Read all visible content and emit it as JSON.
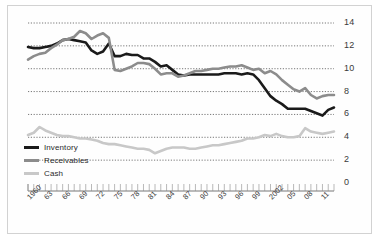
{
  "chart_data": {
    "type": "line",
    "title": "",
    "subtitle": "",
    "xlabel": "",
    "ylabel": "",
    "xlim": [
      1960,
      2013
    ],
    "ylim": [
      0,
      14
    ],
    "grid": true,
    "grid_style": "dotted-horizontal",
    "legend_position": "bottom-left",
    "y_ticks": [
      "0",
      "2",
      "4",
      "6",
      "8",
      "10",
      "12",
      "14"
    ],
    "y_tick_values": [
      0,
      2,
      4,
      6,
      8,
      10,
      12,
      14
    ],
    "x_ticks": [
      "1960",
      "63",
      "66",
      "69",
      "72",
      "75",
      "78",
      "81",
      "84",
      "87",
      "90",
      "93",
      "96",
      "99",
      "2002",
      "05",
      "08",
      "11"
    ],
    "x_tick_values": [
      1960,
      1963,
      1966,
      1969,
      1972,
      1975,
      1978,
      1981,
      1984,
      1987,
      1990,
      1993,
      1996,
      1999,
      2002,
      2005,
      2008,
      2011
    ],
    "x": [
      1960,
      1961,
      1962,
      1963,
      1964,
      1965,
      1966,
      1967,
      1968,
      1969,
      1970,
      1971,
      1972,
      1973,
      1974,
      1975,
      1976,
      1977,
      1978,
      1979,
      1980,
      1981,
      1982,
      1983,
      1984,
      1985,
      1986,
      1987,
      1988,
      1989,
      1990,
      1991,
      1992,
      1993,
      1994,
      1995,
      1996,
      1997,
      1998,
      1999,
      2000,
      2001,
      2002,
      2003,
      2004,
      2005,
      2006,
      2007,
      2008,
      2009,
      2010,
      2011,
      2012,
      2013
    ],
    "series": [
      {
        "name": "Inventory",
        "color": "#1a1a1a",
        "width": 2.6,
        "values": [
          11.9,
          11.8,
          11.8,
          11.9,
          12.0,
          12.2,
          12.5,
          12.6,
          12.5,
          12.4,
          12.3,
          11.6,
          11.3,
          11.5,
          12.2,
          11.1,
          11.1,
          11.3,
          11.2,
          11.2,
          10.9,
          10.9,
          10.6,
          10.2,
          10.3,
          9.9,
          9.5,
          9.4,
          9.5,
          9.5,
          9.5,
          9.5,
          9.5,
          9.5,
          9.6,
          9.6,
          9.6,
          9.5,
          9.6,
          9.5,
          9.0,
          8.3,
          7.6,
          7.2,
          6.9,
          6.5,
          6.5,
          6.5,
          6.5,
          6.3,
          6.1,
          5.9,
          6.4,
          6.6
        ]
      },
      {
        "name": "Receivables",
        "color": "#8c8c8c",
        "width": 2.6,
        "values": [
          10.8,
          11.1,
          11.3,
          11.4,
          11.8,
          12.1,
          12.5,
          12.6,
          12.8,
          13.3,
          13.1,
          12.6,
          12.9,
          13.1,
          12.7,
          9.9,
          9.8,
          10.0,
          10.2,
          10.5,
          10.5,
          10.4,
          10.0,
          9.5,
          9.6,
          9.6,
          9.3,
          9.4,
          9.6,
          9.8,
          9.8,
          9.9,
          10.0,
          10.0,
          10.1,
          10.2,
          10.2,
          10.3,
          10.1,
          9.9,
          10.0,
          9.6,
          9.8,
          9.5,
          9.0,
          8.6,
          8.2,
          8.0,
          8.3,
          7.7,
          7.4,
          7.6,
          7.7,
          7.7
        ]
      },
      {
        "name": "Cash",
        "color": "#c8c8c8",
        "width": 2.6,
        "values": [
          4.2,
          4.4,
          4.9,
          4.6,
          4.4,
          4.2,
          4.1,
          4.1,
          4.0,
          3.9,
          3.9,
          3.8,
          3.7,
          3.5,
          3.4,
          3.4,
          3.3,
          3.2,
          3.1,
          3.0,
          3.0,
          2.9,
          2.6,
          2.8,
          3.0,
          3.1,
          3.1,
          3.1,
          3.0,
          3.0,
          3.1,
          3.2,
          3.3,
          3.3,
          3.4,
          3.5,
          3.6,
          3.7,
          3.9,
          3.9,
          4.0,
          4.2,
          4.1,
          4.3,
          4.1,
          4.0,
          4.0,
          4.1,
          4.8,
          4.5,
          4.4,
          4.3,
          4.4,
          4.5
        ]
      }
    ]
  },
  "legend": {
    "items": [
      {
        "label": "Inventory",
        "color": "#1a1a1a"
      },
      {
        "label": "Receivables",
        "color": "#8c8c8c"
      },
      {
        "label": "Cash",
        "color": "#c8c8c8"
      }
    ]
  }
}
